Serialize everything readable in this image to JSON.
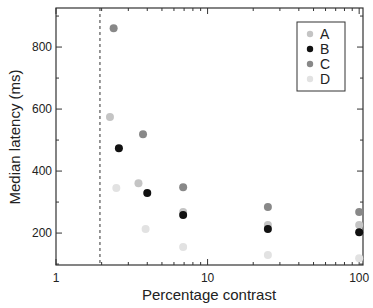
{
  "chart_data": {
    "type": "scatter",
    "title": "",
    "xlabel": "Percentage contrast",
    "ylabel": "Median latency (ms)",
    "xscale": "log",
    "xlim": [
      1,
      106
    ],
    "ylim": [
      97,
      926
    ],
    "x_ticks": [
      1,
      10,
      100
    ],
    "x_tick_labels": [
      "1",
      "10",
      "100"
    ],
    "y_ticks": [
      200,
      400,
      600,
      800
    ],
    "y_tick_labels": [
      "200",
      "400",
      "600",
      "800"
    ],
    "grid": false,
    "legend_position": "upper right",
    "annotations": [
      {
        "type": "vertical-dashed-line",
        "x": 1.95
      }
    ],
    "series": [
      {
        "name": "A",
        "color": "#c4c4c4",
        "points": [
          [
            2.27,
            574
          ],
          [
            3.5,
            361
          ],
          [
            6.9,
            268
          ],
          [
            25,
            226
          ],
          [
            100,
            226
          ]
        ]
      },
      {
        "name": "B",
        "color": "#111111",
        "points": [
          [
            2.6,
            474
          ],
          [
            4.0,
            329
          ],
          [
            6.9,
            258
          ],
          [
            25,
            213
          ],
          [
            100,
            203
          ]
        ]
      },
      {
        "name": "C",
        "color": "#888888",
        "points": [
          [
            2.4,
            861
          ],
          [
            3.75,
            519
          ],
          [
            6.9,
            348
          ],
          [
            25,
            284
          ],
          [
            100,
            268
          ]
        ]
      },
      {
        "name": "D",
        "color": "#e2e2e2",
        "points": [
          [
            2.5,
            345
          ],
          [
            3.9,
            213
          ],
          [
            6.9,
            155
          ],
          [
            25,
            129
          ],
          [
            100,
            119
          ]
        ]
      }
    ]
  }
}
